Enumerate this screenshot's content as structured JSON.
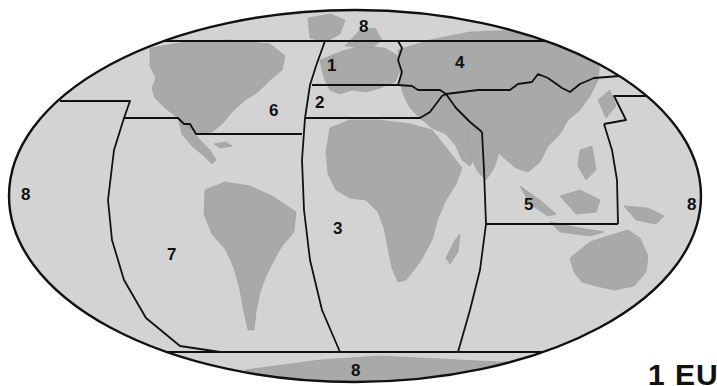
{
  "map": {
    "projection": "world-ellipse",
    "colors": {
      "ocean": "#d3d3d3",
      "land": "#a9a9a9",
      "boundary": "#111111",
      "background": "#ffffff"
    },
    "regions": [
      {
        "id": "1",
        "label": "1"
      },
      {
        "id": "2",
        "label": "2"
      },
      {
        "id": "3",
        "label": "3"
      },
      {
        "id": "4",
        "label": "4"
      },
      {
        "id": "5",
        "label": "5"
      },
      {
        "id": "6",
        "label": "6"
      },
      {
        "id": "7",
        "label": "7"
      },
      {
        "id": "8-top",
        "label": "8"
      },
      {
        "id": "8-left",
        "label": "8"
      },
      {
        "id": "8-right",
        "label": "8"
      },
      {
        "id": "8-bottom",
        "label": "8"
      }
    ]
  },
  "caption": {
    "text": "1 EU"
  }
}
